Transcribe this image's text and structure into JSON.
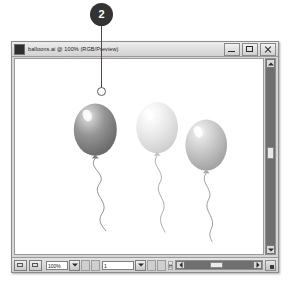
{
  "callout": {
    "number": "2",
    "target_label": "hand-grab-point"
  },
  "window": {
    "title": "balloons.ai @ 100% (RGB/Preview)",
    "app_icon": "illustrator-app-icon",
    "controls": [
      {
        "name": "minimize-button",
        "glyph": "minimize-icon"
      },
      {
        "name": "maximize-button",
        "glyph": "maximize-icon"
      },
      {
        "name": "close-button",
        "glyph": "close-icon"
      }
    ]
  },
  "statusbar": {
    "zoom_value": "100%",
    "page_value": "1",
    "tool_name": "Hand",
    "icons": [
      "artboard-icon",
      "document-icon"
    ],
    "nav_first": "|<",
    "nav_prev": "<",
    "nav_next": ">",
    "nav_last": ">|"
  },
  "scrollbars": {
    "vertical_name": "vertical-scrollbar",
    "horizontal_name": "horizontal-scrollbar"
  },
  "artwork": {
    "title": "Three balloons illustration",
    "background": "#ffffff",
    "balloons": [
      {
        "name": "balloon-left",
        "cx": 60,
        "cy": 105,
        "rx": 32,
        "ry": 39,
        "fill_light": "#b4b4b4",
        "fill_mid": "#8d8d8d",
        "fill_dark": "#6d6d6d",
        "highlight": "#f2f2f2",
        "knot_x": 60,
        "knot_y": 146,
        "string": "M60,148 C48,162 78,170 66,186 C54,202 82,212 70,230 C62,242 72,250 76,256"
      },
      {
        "name": "balloon-middle",
        "cx": 152,
        "cy": 102,
        "rx": 31,
        "ry": 38,
        "fill_light": "#fdfdfd",
        "fill_mid": "#ececec",
        "fill_dark": "#d3d3d3",
        "highlight": "#ffffff",
        "knot_x": 152,
        "knot_y": 142,
        "string": "M152,144 C141,158 166,168 156,184 C146,200 170,210 160,228 C153,240 160,250 164,258"
      },
      {
        "name": "balloon-right",
        "cx": 225,
        "cy": 128,
        "rx": 31,
        "ry": 38,
        "fill_light": "#e0e0e0",
        "fill_mid": "#c2c2c2",
        "fill_dark": "#a3a3a3",
        "highlight": "#fbfbfb",
        "knot_x": 225,
        "knot_y": 168,
        "string": "M225,170 C214,184 238,194 228,210 C219,226 242,236 232,254 C228,262 232,268 234,272"
      }
    ]
  }
}
